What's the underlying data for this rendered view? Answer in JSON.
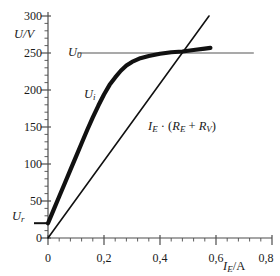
{
  "chart_data": {
    "type": "line",
    "title": "",
    "xlabel": "I_E/A",
    "ylabel": "U/V",
    "xlim": [
      0,
      0.8
    ],
    "ylim": [
      0,
      300
    ],
    "grid": false,
    "legend": "none",
    "x_tick_labels": [
      "0",
      "0,2",
      "0,4",
      "0,6",
      "0,8"
    ],
    "x_tick_values": [
      0,
      0.2,
      0.4,
      0.6,
      0.8
    ],
    "x_minor_tick_step": 0.04,
    "y_tick_labels": [
      "0",
      "50",
      "100",
      "150",
      "200",
      "250",
      "300"
    ],
    "y_tick_values": [
      0,
      50,
      100,
      150,
      200,
      250,
      300
    ],
    "y_minor_tick_step": 10,
    "annotations": [
      {
        "name": "U_0",
        "text_main": "U",
        "text_sub": "0",
        "value": 250,
        "kind": "horizontal-line-label"
      },
      {
        "name": "U_i",
        "text_main": "U",
        "text_sub": "i",
        "kind": "curve-label"
      },
      {
        "name": "U_r",
        "text_main": "U",
        "text_sub": "r",
        "value": 20,
        "kind": "axis-marker-label"
      }
    ],
    "series": [
      {
        "name": "U_0",
        "label": "U_0",
        "type": "horizontal-line",
        "color": "#8c8c8c",
        "width": 1.4,
        "y": 250,
        "x_start": 0.105,
        "x_end": 0.735
      },
      {
        "name": "U_i",
        "label": "U_i",
        "type": "curve",
        "color": "#111111",
        "width": 4.2,
        "points": [
          [
            0.0,
            20
          ],
          [
            0.02,
            38
          ],
          [
            0.04,
            56
          ],
          [
            0.06,
            74
          ],
          [
            0.08,
            92
          ],
          [
            0.1,
            110
          ],
          [
            0.12,
            128
          ],
          [
            0.14,
            146
          ],
          [
            0.16,
            163
          ],
          [
            0.18,
            179
          ],
          [
            0.2,
            194
          ],
          [
            0.22,
            207
          ],
          [
            0.24,
            217
          ],
          [
            0.26,
            226
          ],
          [
            0.28,
            233
          ],
          [
            0.3,
            238
          ],
          [
            0.33,
            243
          ],
          [
            0.36,
            246
          ],
          [
            0.4,
            249
          ],
          [
            0.44,
            251
          ],
          [
            0.48,
            252
          ],
          [
            0.52,
            254
          ],
          [
            0.56,
            256
          ],
          [
            0.58,
            257
          ]
        ]
      },
      {
        "name": "load-line",
        "label": "I_E · (R_E + R_V)",
        "type": "straight-line",
        "color": "#111111",
        "width": 1.6,
        "points": [
          [
            0.0,
            0
          ],
          [
            0.575,
            300
          ]
        ]
      }
    ],
    "load_line_label": {
      "parts": [
        "I",
        "E",
        " · (",
        "R",
        "E",
        " + ",
        "R",
        "V",
        ")"
      ]
    },
    "intersection": {
      "x": 0.48,
      "y": 250
    }
  },
  "labels": {
    "y_axis_title": "U/V",
    "y_axis_title_main": "U",
    "y_axis_title_unit": "/V",
    "x_axis_title_main": "I",
    "x_axis_title_sub": "E",
    "x_axis_title_unit": "/A",
    "u0_main": "U",
    "u0_sub": "0",
    "ui_main": "U",
    "ui_sub": "i",
    "ur_main": "U",
    "ur_sub": "r",
    "loadline_i": "I",
    "loadline_i_sub": "E",
    "loadline_dot": " · (",
    "loadline_re": "R",
    "loadline_re_sub": "E",
    "loadline_plus": " + ",
    "loadline_rv": "R",
    "loadline_rv_sub": "V",
    "loadline_close": ")",
    "y_ticks": [
      "300",
      "250",
      "200",
      "150",
      "100",
      "50",
      "0"
    ],
    "x_ticks": [
      "0",
      "0,2",
      "0,4",
      "0,6",
      "0,8"
    ]
  },
  "colors": {
    "axis": "#4d4d4d",
    "curve": "#111111",
    "u0_line": "#8c8c8c",
    "text": "#1a1a1a"
  }
}
